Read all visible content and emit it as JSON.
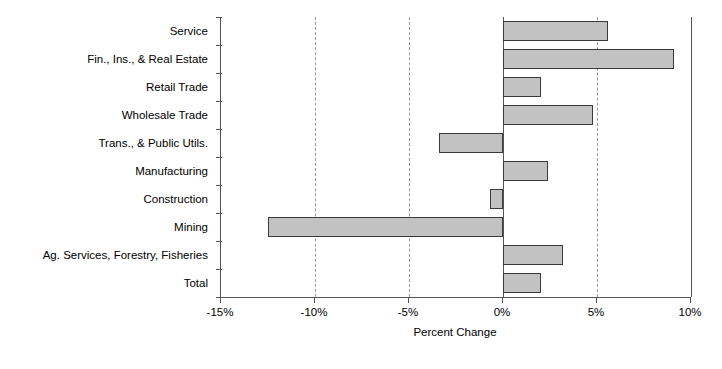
{
  "chart_data": {
    "type": "bar",
    "orientation": "horizontal",
    "title": "",
    "xlabel": "Percent Change",
    "ylabel": "",
    "xlim": [
      -15,
      10
    ],
    "xticks": [
      -15,
      -10,
      -5,
      0,
      5,
      10
    ],
    "xtick_labels": [
      "-15%",
      "-10%",
      "-5%",
      "0%",
      "5%",
      "10%"
    ],
    "grid": true,
    "grid_axis": "x",
    "legend": null,
    "bar_fill_color": "#c2c2c2",
    "bar_edge_color": "#3a3a3a",
    "axis_color": "#555555",
    "gridline_color": "#9a9a9a",
    "categories": [
      "Service",
      "Fin., Ins., & Real Estate",
      "Retail Trade",
      "Wholesale Trade",
      "Trans., & Public Utils.",
      "Manufacturing",
      "Construction",
      "Mining",
      "Ag. Services, Forestry, Fisheries",
      "Total"
    ],
    "values": [
      5.6,
      9.1,
      2.0,
      4.8,
      -3.4,
      2.4,
      -0.7,
      -12.5,
      3.2,
      2.0
    ],
    "value_labels": [
      "5.6%",
      "9.1%",
      "2.0%",
      "4.8%",
      "-3.4%",
      "2.4%",
      "-0.7%",
      "-12.5%",
      "3.2%",
      "2.0%"
    ]
  }
}
